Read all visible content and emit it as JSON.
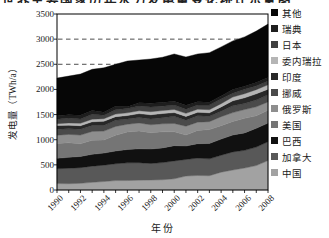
{
  "figure": {
    "clipped_caption_fragment": "世界主要国家历年水力发电量变化统计示意图"
  },
  "chart_data": {
    "type": "area",
    "stacked": true,
    "xlabel": "年份",
    "ylabel": "发电量（TWh/a）",
    "ylim": [
      0,
      3500
    ],
    "y_ticks": [
      0,
      500,
      1000,
      1500,
      2000,
      2500,
      3000,
      3500
    ],
    "gridlines_at": [
      2500,
      3000
    ],
    "grid_style": "dashed",
    "legend_position": "right",
    "x": [
      1990,
      1991,
      1992,
      1993,
      1994,
      1995,
      1996,
      1997,
      1998,
      1999,
      2000,
      2001,
      2002,
      2003,
      2004,
      2005,
      2006,
      2007,
      2008
    ],
    "x_tick_labels": [
      "1990",
      "1992",
      "1994",
      "1996",
      "1998",
      "2000",
      "2002",
      "2004",
      "2006",
      "2008"
    ],
    "series": [
      {
        "name": "china",
        "label": "中国",
        "color": "#a2a2a2",
        "values": [
          127,
          125,
          132,
          152,
          168,
          187,
          188,
          196,
          198,
          204,
          222,
          277,
          288,
          284,
          354,
          397,
          436,
          485,
          585
        ]
      },
      {
        "name": "canada",
        "label": "加拿大",
        "color": "#585858",
        "values": [
          296,
          307,
          312,
          322,
          326,
          335,
          352,
          347,
          329,
          341,
          356,
          330,
          347,
          335,
          337,
          360,
          352,
          368,
          375
        ]
      },
      {
        "name": "brazil",
        "label": "巴西",
        "color": "#111111",
        "values": [
          207,
          217,
          223,
          235,
          240,
          254,
          265,
          276,
          288,
          292,
          304,
          268,
          286,
          306,
          321,
          337,
          348,
          374,
          370
        ]
      },
      {
        "name": "usa",
        "label": "美国",
        "color": "#757575",
        "values": [
          293,
          289,
          253,
          281,
          260,
          311,
          347,
          356,
          323,
          319,
          276,
          217,
          264,
          276,
          268,
          270,
          289,
          248,
          255
        ]
      },
      {
        "name": "russia",
        "label": "俄罗斯",
        "color": "#8e8e8e",
        "values": [
          166,
          168,
          172,
          175,
          177,
          177,
          155,
          158,
          159,
          161,
          165,
          176,
          164,
          158,
          178,
          175,
          175,
          179,
          167
        ]
      },
      {
        "name": "norway",
        "label": "挪威",
        "color": "#4a4a4a",
        "values": [
          121,
          111,
          117,
          120,
          113,
          123,
          105,
          111,
          116,
          122,
          142,
          121,
          130,
          106,
          110,
          137,
          120,
          135,
          140
        ]
      },
      {
        "name": "india",
        "label": "印度",
        "color": "#282828",
        "values": [
          72,
          73,
          70,
          71,
          83,
          72,
          69,
          75,
          83,
          82,
          74,
          74,
          68,
          70,
          85,
          99,
          114,
          124,
          114
        ]
      },
      {
        "name": "venezuela",
        "label": "委内瑞拉",
        "color": "#b5b5b5",
        "values": [
          36,
          44,
          48,
          52,
          51,
          51,
          54,
          57,
          61,
          59,
          62,
          61,
          60,
          61,
          64,
          74,
          81,
          83,
          86
        ]
      },
      {
        "name": "japan",
        "label": "日本",
        "color": "#404040",
        "values": [
          89,
          97,
          84,
          98,
          69,
          85,
          84,
          92,
          96,
          87,
          87,
          84,
          83,
          94,
          94,
          77,
          88,
          74,
          75
        ]
      },
      {
        "name": "sweden",
        "label": "瑞典",
        "color": "#1e1e1e",
        "values": [
          72,
          63,
          74,
          74,
          59,
          68,
          37,
          69,
          74,
          71,
          78,
          79,
          66,
          53,
          60,
          72,
          61,
          66,
          69
        ]
      },
      {
        "name": "other",
        "label": "其他",
        "color": "#060606",
        "values": [
          746,
          771,
          820,
          820,
          884,
          837,
          909,
          848,
          878,
          902,
          939,
          958,
          949,
          987,
          974,
          967,
          981,
          1024,
          1064
        ]
      }
    ]
  }
}
